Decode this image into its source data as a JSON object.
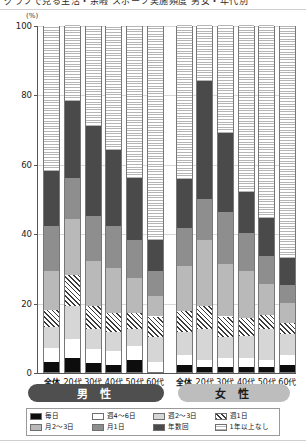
{
  "top_strip": {
    "clipped_text": "グラフで見る生活・余暇 スポーツ実施頻度 男女・年代別"
  },
  "chart_data": {
    "type": "bar",
    "subtype": "stacked-percentage",
    "title": "",
    "unit_label": "(%)",
    "xlabel": "",
    "ylabel": "",
    "ylim": [
      0,
      100
    ],
    "yticks": [
      0,
      20,
      40,
      60,
      80,
      100
    ],
    "grid": true,
    "legend_position": "bottom",
    "groups": [
      {
        "name": "男 性",
        "categories": [
          "全体",
          "20代",
          "30代",
          "40代",
          "50代",
          "60代"
        ]
      },
      {
        "name": "女 性",
        "categories": [
          "全体",
          "20代",
          "30代",
          "40代",
          "50代",
          "60代"
        ]
      }
    ],
    "series": [
      {
        "name": "毎日",
        "key": "mainichi",
        "color": "#0d0d0d",
        "pattern": "solid-black",
        "values": [
          3.0,
          4.0,
          2.5,
          2.0,
          3.5,
          0.0,
          2.0,
          1.5,
          1.5,
          1.5,
          1.5,
          2.0
        ]
      },
      {
        "name": "週4〜6日",
        "key": "w46",
        "color": "#ffffff",
        "pattern": "solid-white",
        "values": [
          4.0,
          5.5,
          4.0,
          4.0,
          4.0,
          3.0,
          3.0,
          2.0,
          2.5,
          2.5,
          2.0,
          3.0
        ]
      },
      {
        "name": "週2〜3日",
        "key": "w23",
        "color": "#d6d6d6",
        "pattern": "light-gray",
        "values": [
          6.0,
          9.5,
          6.0,
          5.5,
          5.0,
          7.0,
          6.5,
          9.0,
          6.0,
          6.5,
          9.0,
          6.0
        ]
      },
      {
        "name": "週1日",
        "key": "w1",
        "color": "#3a3a3a",
        "pattern": "diagonal-hatch",
        "values": [
          5.0,
          9.0,
          6.5,
          5.5,
          4.5,
          6.0,
          6.0,
          6.5,
          6.0,
          5.0,
          4.0,
          3.0
        ]
      },
      {
        "name": "月2〜3日",
        "key": "m23",
        "color": "#b9b9b9",
        "pattern": "mid-light-gray",
        "values": [
          11.0,
          16.0,
          13.0,
          13.0,
          10.0,
          6.0,
          13.0,
          19.0,
          15.0,
          13.5,
          9.0,
          6.0
        ]
      },
      {
        "name": "月1日",
        "key": "m1",
        "color": "#8e8e8e",
        "pattern": "mid-gray",
        "values": [
          13.0,
          12.0,
          13.0,
          12.0,
          11.0,
          7.0,
          11.0,
          12.0,
          15.0,
          11.0,
          8.0,
          5.0
        ]
      },
      {
        "name": "年数回",
        "key": "nensukai",
        "color": "#4a4a4a",
        "pattern": "dark-gray",
        "values": [
          16.0,
          22.0,
          26.0,
          22.0,
          18.0,
          9.0,
          14.0,
          34.0,
          23.0,
          12.0,
          11.0,
          8.0
        ]
      },
      {
        "name": "1年以上なし",
        "key": "none",
        "color": "#b5b5b5",
        "pattern": "fine-checker",
        "values": [
          42.0,
          22.0,
          29.0,
          36.0,
          44.0,
          62.0,
          44.5,
          16.0,
          31.0,
          48.0,
          55.5,
          67.0
        ]
      }
    ],
    "cumulative_tops": {
      "male": [
        58.0,
        78.0,
        71.0,
        64.0,
        56.0,
        38.0
      ],
      "female": [
        55.5,
        84.0,
        69.0,
        52.0,
        44.5,
        33.0
      ]
    }
  },
  "legend": {
    "items": [
      {
        "label": "毎日",
        "key": "mainichi"
      },
      {
        "label": "週4〜6日",
        "key": "w46"
      },
      {
        "label": "週2〜3日",
        "key": "w23"
      },
      {
        "label": "週1日",
        "key": "w1"
      },
      {
        "label": "月2〜3日",
        "key": "m23"
      },
      {
        "label": "月1日",
        "key": "m1"
      },
      {
        "label": "年数回",
        "key": "nensukai"
      },
      {
        "label": "1年以上なし",
        "key": "none"
      }
    ]
  }
}
